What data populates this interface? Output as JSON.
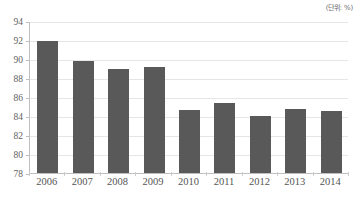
{
  "caption": {
    "unit_label": "(단위: %)"
  },
  "chart_data": {
    "type": "bar",
    "title": "",
    "subtitle": "",
    "xlabel": "",
    "ylabel": "",
    "unit": "%",
    "categories": [
      "2006",
      "2007",
      "2008",
      "2009",
      "2010",
      "2011",
      "2012",
      "2013",
      "2014"
    ],
    "values": [
      91.9,
      89.8,
      89.0,
      89.2,
      84.6,
      85.4,
      84.0,
      84.7,
      84.5
    ],
    "series": [
      {
        "name": "",
        "values": [
          91.9,
          89.8,
          89.0,
          89.2,
          84.6,
          85.4,
          84.0,
          84.7,
          84.5
        ]
      }
    ],
    "ylim": [
      78,
      94
    ],
    "ytick_values": [
      78,
      80,
      82,
      84,
      86,
      88,
      90,
      92,
      94
    ],
    "ytick_labels": [
      "78",
      "80",
      "82",
      "84",
      "86",
      "88",
      "90",
      "92",
      "94"
    ],
    "grid": true,
    "grid_axis": "y",
    "legend": false,
    "legend_position": "none",
    "bar_color": "#595959",
    "gridline_color": "#e6e6e6",
    "axis_color": "#bfbfbf",
    "text_color": "#555555",
    "background_color": "#ffffff"
  }
}
